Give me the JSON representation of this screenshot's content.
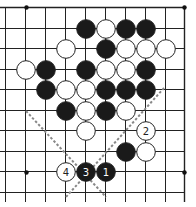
{
  "diagram": {
    "type": "go-board-fragment",
    "grid": {
      "cols": 10,
      "rows": 10,
      "x0": 5,
      "y0": 8,
      "dx": 20,
      "dy": 20.5,
      "right_edge_x": 184,
      "top_edge_y": 7,
      "line_color": "#222222"
    },
    "star_points": [
      {
        "col": 3.55,
        "row": -0.05,
        "px": [
          26,
          7
        ]
      },
      {
        "col": 9,
        "row": 0,
        "px": [
          184,
          7
        ]
      },
      {
        "col": 1,
        "row": 9,
        "px": [
          26,
          172
        ]
      },
      {
        "col": 9,
        "row": 8,
        "px": [
          184,
          172
        ]
      }
    ],
    "stones": [
      {
        "color": "black",
        "x": 86,
        "y": 29
      },
      {
        "color": "white",
        "x": 106,
        "y": 29
      },
      {
        "color": "black",
        "x": 126,
        "y": 29
      },
      {
        "color": "black",
        "x": 146,
        "y": 29
      },
      {
        "color": "white",
        "x": 66,
        "y": 49
      },
      {
        "color": "black",
        "x": 106,
        "y": 49
      },
      {
        "color": "white",
        "x": 126,
        "y": 49
      },
      {
        "color": "white",
        "x": 146,
        "y": 49
      },
      {
        "color": "white",
        "x": 166,
        "y": 49
      },
      {
        "color": "white",
        "x": 26,
        "y": 70
      },
      {
        "color": "black",
        "x": 46,
        "y": 70
      },
      {
        "color": "black",
        "x": 86,
        "y": 70
      },
      {
        "color": "white",
        "x": 106,
        "y": 70
      },
      {
        "color": "white",
        "x": 126,
        "y": 70
      },
      {
        "color": "black",
        "x": 146,
        "y": 70
      },
      {
        "color": "black",
        "x": 46,
        "y": 90
      },
      {
        "color": "white",
        "x": 66,
        "y": 90
      },
      {
        "color": "white",
        "x": 86,
        "y": 90
      },
      {
        "color": "black",
        "x": 106,
        "y": 90
      },
      {
        "color": "black",
        "x": 126,
        "y": 90
      },
      {
        "color": "black",
        "x": 146,
        "y": 90
      },
      {
        "color": "black",
        "x": 66,
        "y": 111
      },
      {
        "color": "white",
        "x": 86,
        "y": 111
      },
      {
        "color": "black",
        "x": 106,
        "y": 111
      },
      {
        "color": "white",
        "x": 126,
        "y": 111
      },
      {
        "color": "white",
        "x": 86,
        "y": 131
      },
      {
        "color": "white",
        "x": 146,
        "y": 131,
        "label": "2"
      },
      {
        "color": "black",
        "x": 126,
        "y": 152
      },
      {
        "color": "white",
        "x": 146,
        "y": 152
      },
      {
        "color": "white",
        "x": 66,
        "y": 172,
        "label": "4"
      },
      {
        "color": "black",
        "x": 86,
        "y": 172,
        "label": "3"
      },
      {
        "color": "black",
        "x": 106,
        "y": 172,
        "label": "1"
      }
    ],
    "dashed_lines": [
      {
        "from": [
          26,
          111
        ],
        "to": [
          106,
          197
        ]
      },
      {
        "from": [
          164,
          88
        ],
        "to": [
          66,
          197
        ]
      }
    ],
    "colors": {
      "black_stone": "#1a1a1a",
      "white_stone": "#ffffff",
      "stone_outline": "#222222",
      "dash": "#888888"
    }
  }
}
